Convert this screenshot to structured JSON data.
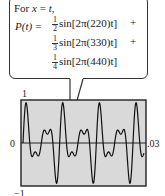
{
  "callout": {
    "line1_prefix": "For ",
    "line1_var": "x",
    "line1_eq": " = ",
    "line1_val": "t",
    "line1_suffix": ",",
    "lhs": "P(t) = ",
    "terms": [
      {
        "num": "1",
        "den": "2",
        "text": "sin[2π(220)t]",
        "op": "+"
      },
      {
        "num": "1",
        "den": "3",
        "text": "sin[2π(330)t]",
        "op": "+"
      },
      {
        "num": "1",
        "den": "4",
        "text": "sin[2π(440)t]",
        "op": ""
      }
    ]
  },
  "chart_data": {
    "type": "line",
    "title": "",
    "function": "P(t) = 1/2 sin[2π(220)t] + 1/3 sin[2π(330)t] + 1/4 sin[2π(440)t]",
    "xlabel": "t",
    "ylabel": "P(t)",
    "xlim": [
      0,
      0.03
    ],
    "ylim": [
      -1,
      1
    ],
    "tick_labels": {
      "y_top": "1",
      "y_bottom": "−1",
      "y_zero": "0",
      "x_right": ".03"
    },
    "frequencies_hz": [
      220,
      330,
      440
    ],
    "amplitudes": [
      0.5,
      0.3333,
      0.25
    ],
    "grid": false,
    "background": "#d9d9d9",
    "line_color": "#111111"
  }
}
